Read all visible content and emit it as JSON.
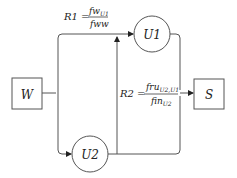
{
  "diagram": {
    "nodes": {
      "w": {
        "label": "W"
      },
      "s": {
        "label": "S"
      },
      "u1": {
        "label": "U1"
      },
      "u2": {
        "label": "U2"
      }
    },
    "ratios": {
      "r1": {
        "name": "R1 =",
        "numerator": "fw",
        "numerator_sub": "U1",
        "denominator": "fww"
      },
      "r2": {
        "name": "R2 =",
        "numerator": "fru",
        "numerator_sub": "U2,U1",
        "denominator": "fin",
        "denominator_sub": "U2"
      }
    },
    "colors": {
      "stroke": "#555555",
      "text": "#222222"
    }
  }
}
